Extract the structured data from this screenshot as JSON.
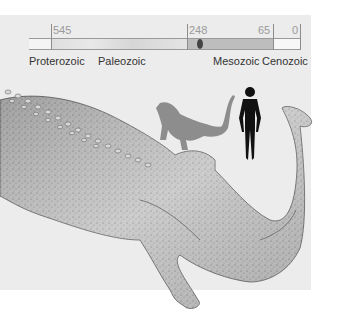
{
  "timeline": {
    "ticks": [
      {
        "label": "545",
        "pos": 22
      },
      {
        "label": "248",
        "pos": 158
      },
      {
        "label": "65",
        "pos": 244
      },
      {
        "label": "0",
        "pos": 271
      }
    ],
    "eras": [
      {
        "label": "Proterozoic",
        "x": 0
      },
      {
        "label": "Paleozoic",
        "x": 69
      },
      {
        "label": "Mesozoic",
        "x": 184
      },
      {
        "label": "Cenozoic",
        "x": 233
      }
    ],
    "segments": [
      {
        "name": "proterozoic",
        "color": "#f4f4f4"
      },
      {
        "name": "paleozoic",
        "color": "#dcdcdc"
      },
      {
        "name": "mesozoic",
        "color": "#b9b9b9"
      },
      {
        "name": "cenozoic",
        "color": "#f7f7f7"
      }
    ],
    "marker": {
      "label": "species time marker",
      "pos": 171
    }
  },
  "illustration": {
    "subject": "large extinct amphibian (dorsal view)",
    "scale_figures": [
      "creature silhouette",
      "human silhouette"
    ]
  }
}
